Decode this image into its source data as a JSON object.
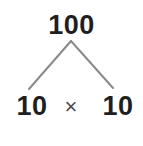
{
  "figure": {
    "kind": "factor-tree",
    "background_color": "#ffffff",
    "text_color": "#1f1f1f",
    "branch_color": "#8a8a8a",
    "operator_color": "#4a4a4a",
    "width": 143,
    "height": 146
  },
  "root": {
    "label": "100"
  },
  "operator": {
    "symbol": "×",
    "name": "multiplication-sign"
  },
  "factors": [
    {
      "label": "10"
    },
    {
      "label": "10"
    }
  ],
  "branches": [
    {
      "name": "left-branch",
      "from_x": 71,
      "from_y": 41,
      "to_x": 29,
      "to_y": 89
    },
    {
      "name": "right-branch",
      "from_x": 71,
      "from_y": 41,
      "to_x": 113,
      "to_y": 88
    }
  ],
  "equation": "100 = 10 × 10"
}
